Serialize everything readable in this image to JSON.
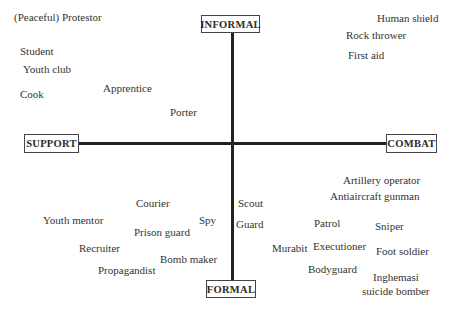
{
  "axes": {
    "top": "INFORMAL",
    "bottom": "FORMAL",
    "left": "SUPPORT",
    "right": "COMBAT"
  },
  "labels": [
    {
      "text": "(Peaceful) Protestor",
      "x": 14,
      "y": 21
    },
    {
      "text": "Student",
      "x": 20,
      "y": 55
    },
    {
      "text": "Youth club",
      "x": 23,
      "y": 73
    },
    {
      "text": "Cook",
      "x": 20,
      "y": 98
    },
    {
      "text": "Apprentice",
      "x": 103,
      "y": 92
    },
    {
      "text": "Porter",
      "x": 170,
      "y": 116
    },
    {
      "text": "Human shield",
      "x": 377,
      "y": 22
    },
    {
      "text": "Rock thrower",
      "x": 346,
      "y": 39
    },
    {
      "text": "First aid",
      "x": 348,
      "y": 59
    },
    {
      "text": "Courier",
      "x": 136,
      "y": 207
    },
    {
      "text": "Youth mentor",
      "x": 43,
      "y": 224
    },
    {
      "text": "Spy",
      "x": 199,
      "y": 224
    },
    {
      "text": "Prison guard",
      "x": 134,
      "y": 236
    },
    {
      "text": "Recruiter",
      "x": 79,
      "y": 252
    },
    {
      "text": "Bomb maker",
      "x": 160,
      "y": 263
    },
    {
      "text": "Propagandist",
      "x": 98,
      "y": 274
    },
    {
      "text": "Scout",
      "x": 238,
      "y": 207
    },
    {
      "text": "Guard",
      "x": 236,
      "y": 228
    },
    {
      "text": "Artillery operator",
      "x": 343,
      "y": 184
    },
    {
      "text": "Antiaircraft gunman",
      "x": 330,
      "y": 200
    },
    {
      "text": "Patrol",
      "x": 314,
      "y": 227
    },
    {
      "text": "Sniper",
      "x": 375,
      "y": 230
    },
    {
      "text": "Murabit",
      "x": 272,
      "y": 252
    },
    {
      "text": "Executioner",
      "x": 313,
      "y": 250
    },
    {
      "text": "Foot soldier",
      "x": 376,
      "y": 255
    },
    {
      "text": "Bodyguard",
      "x": 308,
      "y": 273
    },
    {
      "text": "Inghemasi",
      "x": 373,
      "y": 281
    },
    {
      "text": "suicide bomber",
      "x": 362,
      "y": 295
    }
  ]
}
